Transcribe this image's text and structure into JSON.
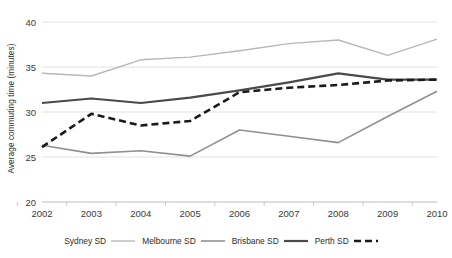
{
  "chart_data": {
    "type": "line",
    "title": "",
    "xlabel": "",
    "ylabel": "Average commuting time (minutes)",
    "categories": [
      "2002",
      "2003",
      "2004",
      "2005",
      "2006",
      "2007",
      "2008",
      "2009",
      "2010"
    ],
    "x": [
      2002,
      2003,
      2004,
      2005,
      2006,
      2007,
      2008,
      2009,
      2010
    ],
    "ylim": [
      20,
      40
    ],
    "yticks": [
      20,
      25,
      30,
      35,
      40
    ],
    "grid": true,
    "legend_position": "bottom",
    "series": [
      {
        "name": "Sydney SD",
        "values": [
          34.3,
          34.0,
          35.8,
          36.1,
          36.8,
          37.6,
          38.0,
          36.3,
          38.1
        ],
        "color": "#b8b8b8",
        "style": "solid",
        "width": 1.4
      },
      {
        "name": "Melbourne SD",
        "values": [
          26.3,
          25.4,
          25.7,
          25.1,
          28.0,
          27.3,
          26.6,
          29.5,
          32.3
        ],
        "color": "#909090",
        "style": "solid",
        "width": 1.6
      },
      {
        "name": "Brisbane SD",
        "values": [
          31.0,
          31.5,
          31.0,
          31.6,
          32.4,
          33.3,
          34.3,
          33.6,
          33.6
        ],
        "color": "#4a4a4a",
        "style": "solid",
        "width": 2.2
      },
      {
        "name": "Perth SD",
        "values": [
          26.1,
          29.8,
          28.5,
          29.0,
          32.2,
          32.7,
          33.0,
          33.5,
          33.6
        ],
        "color": "#1a1a1a",
        "style": "dashed",
        "width": 2.6
      }
    ]
  },
  "axis": {
    "y_tick_labels": [
      "20",
      "25",
      "30",
      "35",
      "40"
    ],
    "x_tick_labels": [
      "2002",
      "2003",
      "2004",
      "2005",
      "2006",
      "2007",
      "2008",
      "2009",
      "2010"
    ],
    "y_axis_title": "Average commuting time (minutes)"
  },
  "legend": {
    "items": [
      {
        "label": "Sydney SD"
      },
      {
        "label": "Melbourne SD"
      },
      {
        "label": "Brisbane SD"
      },
      {
        "label": "Perth SD"
      }
    ]
  },
  "colors": {
    "sydney": "#b8b8b8",
    "melbourne": "#909090",
    "brisbane": "#4a4a4a",
    "perth": "#1a1a1a",
    "grid": "#e2e2e2",
    "axis": "#c9c9c9",
    "text": "#2b2b2b"
  }
}
